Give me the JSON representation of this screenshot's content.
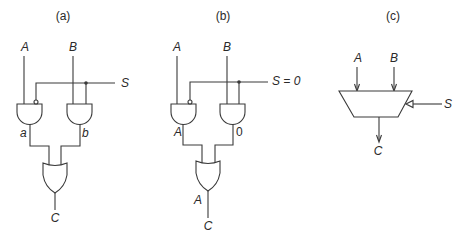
{
  "panels": [
    {
      "caption": "(a)",
      "inputs": {
        "a": "A",
        "b": "B",
        "s": "S"
      },
      "intermediate": {
        "left": "a",
        "right": "b"
      },
      "output": "C",
      "gates": [
        "AND (inverted S input)",
        "AND",
        "OR"
      ]
    },
    {
      "caption": "(b)",
      "inputs": {
        "a": "A",
        "b": "B",
        "s": "S = 0"
      },
      "intermediate": {
        "left": "A",
        "right": "0"
      },
      "or_output": "A",
      "output": "C",
      "gates": [
        "AND (inverted S input)",
        "AND",
        "OR"
      ]
    },
    {
      "caption": "(c)",
      "inputs": {
        "a": "A",
        "b": "B",
        "s": "S"
      },
      "output": "C",
      "symbol": "multiplexer"
    }
  ],
  "colors": {
    "line": "#3a3a3a",
    "background": "#ffffff"
  }
}
